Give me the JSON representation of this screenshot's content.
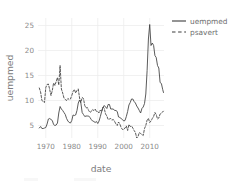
{
  "chart_data": {
    "type": "line",
    "title": "",
    "xlabel": "date",
    "ylabel": "uempmed",
    "xlim": [
      1967,
      2015.5
    ],
    "ylim": [
      2.5,
      26.5
    ],
    "grid": true,
    "legend_position": "right",
    "x_ticks": [
      "1970",
      "1980",
      "1990",
      "2000",
      "2010"
    ],
    "x_tick_values": [
      1970,
      1980,
      1990,
      2000,
      2010
    ],
    "y_ticks": [
      "5",
      "10",
      "15",
      "20",
      "25"
    ],
    "y_tick_values": [
      5,
      10,
      15,
      20,
      25
    ],
    "series": [
      {
        "name": "uempmed",
        "style": "solid",
        "color": "#3d3d3d",
        "x": [
          1967.5,
          1968.0,
          1968.5,
          1969.0,
          1969.5,
          1970.0,
          1970.5,
          1971.0,
          1971.5,
          1972.0,
          1972.5,
          1973.0,
          1973.5,
          1974.0,
          1974.5,
          1975.0,
          1975.5,
          1976.0,
          1976.5,
          1977.0,
          1977.5,
          1978.0,
          1978.5,
          1979.0,
          1979.5,
          1980.0,
          1980.5,
          1981.0,
          1981.5,
          1982.0,
          1982.5,
          1983.0,
          1983.5,
          1984.0,
          1984.5,
          1985.0,
          1985.5,
          1986.0,
          1986.5,
          1987.0,
          1987.5,
          1988.0,
          1988.5,
          1989.0,
          1989.5,
          1990.0,
          1990.5,
          1991.0,
          1991.5,
          1992.0,
          1992.5,
          1993.0,
          1993.5,
          1994.0,
          1994.5,
          1995.0,
          1995.5,
          1996.0,
          1996.5,
          1997.0,
          1997.5,
          1998.0,
          1998.5,
          1999.0,
          1999.5,
          2000.0,
          2000.5,
          2001.0,
          2001.5,
          2002.0,
          2002.5,
          2003.0,
          2003.5,
          2004.0,
          2004.5,
          2005.0,
          2005.5,
          2006.0,
          2006.5,
          2007.0,
          2007.5,
          2008.0,
          2008.5,
          2009.0,
          2009.5,
          2010.0,
          2010.5,
          2011.0,
          2011.5,
          2012.0,
          2012.5,
          2013.0,
          2013.5,
          2014.0,
          2014.5,
          2015.0,
          2015.3
        ],
        "values": [
          4.5,
          4.8,
          4.4,
          4.4,
          4.5,
          4.6,
          5.3,
          6.3,
          6.4,
          6.2,
          6.0,
          5.2,
          5.0,
          5.1,
          5.5,
          7.5,
          8.8,
          8.3,
          8.0,
          7.6,
          7.2,
          6.4,
          5.9,
          5.6,
          5.5,
          6.0,
          7.1,
          7.0,
          7.1,
          8.0,
          9.5,
          10.1,
          9.5,
          7.6,
          7.2,
          6.8,
          6.9,
          6.9,
          6.9,
          6.6,
          6.2,
          5.9,
          5.8,
          5.6,
          5.8,
          5.4,
          5.9,
          6.8,
          7.8,
          8.6,
          9.0,
          8.7,
          8.4,
          9.2,
          9.2,
          8.3,
          8.3,
          8.3,
          8.0,
          8.0,
          7.8,
          6.7,
          6.6,
          6.4,
          6.2,
          5.9,
          6.0,
          6.8,
          7.8,
          9.1,
          9.6,
          10.3,
          10.3,
          9.8,
          9.5,
          8.9,
          8.5,
          8.0,
          7.5,
          8.4,
          8.7,
          9.4,
          11.3,
          16.0,
          22.3,
          25.2,
          21.0,
          21.5,
          21.0,
          19.0,
          18.6,
          17.0,
          16.5,
          13.6,
          13.4,
          12.2,
          11.6
        ]
      },
      {
        "name": "psavert",
        "style": "dashed",
        "color": "#3d3d3d",
        "x": [
          1967.5,
          1968.0,
          1968.5,
          1969.0,
          1969.5,
          1970.0,
          1970.5,
          1971.0,
          1971.5,
          1972.0,
          1972.5,
          1973.0,
          1973.5,
          1974.0,
          1974.5,
          1975.0,
          1975.5,
          1976.0,
          1976.5,
          1977.0,
          1977.5,
          1978.0,
          1978.5,
          1979.0,
          1979.5,
          1980.0,
          1980.5,
          1981.0,
          1981.5,
          1982.0,
          1982.5,
          1983.0,
          1983.5,
          1984.0,
          1984.5,
          1985.0,
          1985.5,
          1986.0,
          1986.5,
          1987.0,
          1987.5,
          1988.0,
          1988.5,
          1989.0,
          1989.5,
          1990.0,
          1990.5,
          1991.0,
          1991.5,
          1992.0,
          1992.5,
          1993.0,
          1993.5,
          1994.0,
          1994.5,
          1995.0,
          1995.5,
          1996.0,
          1996.5,
          1997.0,
          1997.5,
          1998.0,
          1998.5,
          1999.0,
          1999.5,
          2000.0,
          2000.5,
          2001.0,
          2001.5,
          2002.0,
          2002.5,
          2003.0,
          2003.5,
          2004.0,
          2004.5,
          2005.0,
          2005.5,
          2006.0,
          2006.5,
          2007.0,
          2007.5,
          2008.0,
          2008.5,
          2009.0,
          2009.5,
          2010.0,
          2010.5,
          2011.0,
          2011.5,
          2012.0,
          2012.5,
          2013.0,
          2013.5,
          2014.0,
          2014.5,
          2015.0,
          2015.3
        ],
        "values": [
          12.5,
          11.7,
          10.0,
          9.8,
          9.6,
          12.6,
          13.2,
          13.3,
          12.2,
          11.0,
          12.0,
          13.5,
          13.0,
          13.8,
          14.6,
          13.1,
          17.0,
          12.3,
          11.5,
          10.5,
          10.2,
          10.0,
          10.4,
          10.2,
          10.3,
          11.0,
          11.8,
          12.2,
          11.5,
          12.0,
          12.3,
          10.5,
          9.6,
          10.6,
          10.4,
          9.0,
          8.5,
          8.6,
          8.0,
          7.6,
          7.8,
          8.2,
          8.0,
          8.3,
          7.8,
          7.8,
          7.5,
          8.1,
          7.8,
          8.7,
          8.4,
          7.3,
          6.9,
          6.2,
          6.3,
          6.4,
          6.1,
          6.2,
          5.8,
          5.3,
          5.0,
          5.7,
          5.3,
          4.6,
          4.2,
          4.2,
          4.5,
          4.9,
          4.0,
          5.2,
          4.8,
          4.9,
          4.5,
          4.0,
          3.6,
          2.5,
          2.8,
          3.6,
          3.4,
          3.2,
          3.0,
          4.4,
          5.0,
          6.1,
          6.4,
          5.6,
          5.9,
          6.4,
          6.8,
          7.6,
          7.2,
          6.3,
          6.5,
          7.3,
          7.5,
          7.7,
          7.9
        ]
      }
    ],
    "legend": [
      {
        "label": "uempmed",
        "style": "solid"
      },
      {
        "label": "psavert",
        "style": "dashed"
      }
    ]
  },
  "axes": {
    "x_title": "date",
    "y_title": "uempmed"
  }
}
